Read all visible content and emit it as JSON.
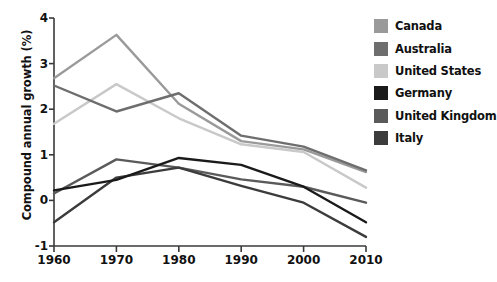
{
  "chart_data": {
    "type": "line",
    "title": "",
    "xlabel": "",
    "ylabel": "Compound annual growth (%)",
    "x": [
      1960,
      1970,
      1980,
      1990,
      2000,
      2010
    ],
    "xticklabels": [
      "1960",
      "1970",
      "1980",
      "1990",
      "2000",
      "2010"
    ],
    "xlim": [
      1960,
      2010
    ],
    "ylim": [
      -1,
      4
    ],
    "yticks": [
      -1,
      0,
      1,
      2,
      3,
      4
    ],
    "yticklabels": [
      "-1",
      "0",
      "1",
      "2",
      "3",
      "4"
    ],
    "grid": false,
    "legend_position": "right",
    "series": [
      {
        "name": "Canada",
        "color": "#9a9a9a",
        "values": [
          2.68,
          3.63,
          2.12,
          1.3,
          1.12,
          0.62
        ]
      },
      {
        "name": "Australia",
        "color": "#6e6e6e",
        "values": [
          2.52,
          1.95,
          2.35,
          1.42,
          1.18,
          0.66
        ]
      },
      {
        "name": "United States",
        "color": "#c9c9c9",
        "values": [
          1.68,
          2.55,
          1.8,
          1.23,
          1.06,
          0.28
        ]
      },
      {
        "name": "Germany",
        "color": "#1a1a1a",
        "values": [
          0.22,
          0.45,
          0.93,
          0.78,
          0.3,
          -0.48
        ]
      },
      {
        "name": "United Kingdom",
        "color": "#5a5a5a",
        "values": [
          0.15,
          0.9,
          0.72,
          0.46,
          0.3,
          -0.05
        ]
      },
      {
        "name": "Italy",
        "color": "#3c3c3c",
        "values": [
          -0.48,
          0.5,
          0.72,
          0.32,
          -0.05,
          -0.8
        ]
      }
    ]
  },
  "axes": {
    "y_title": "Compound annual growth (%)",
    "axis_color": "#3a3a3a",
    "tick_color": "#3a3a3a",
    "label_color": "#111111"
  },
  "legend": {
    "items": [
      {
        "label": "Canada",
        "color": "#9a9a9a"
      },
      {
        "label": "Australia",
        "color": "#6e6e6e"
      },
      {
        "label": "United States",
        "color": "#c9c9c9"
      },
      {
        "label": "Germany",
        "color": "#1a1a1a"
      },
      {
        "label": "United Kingdom",
        "color": "#5a5a5a"
      },
      {
        "label": "Italy",
        "color": "#3c3c3c"
      }
    ]
  }
}
